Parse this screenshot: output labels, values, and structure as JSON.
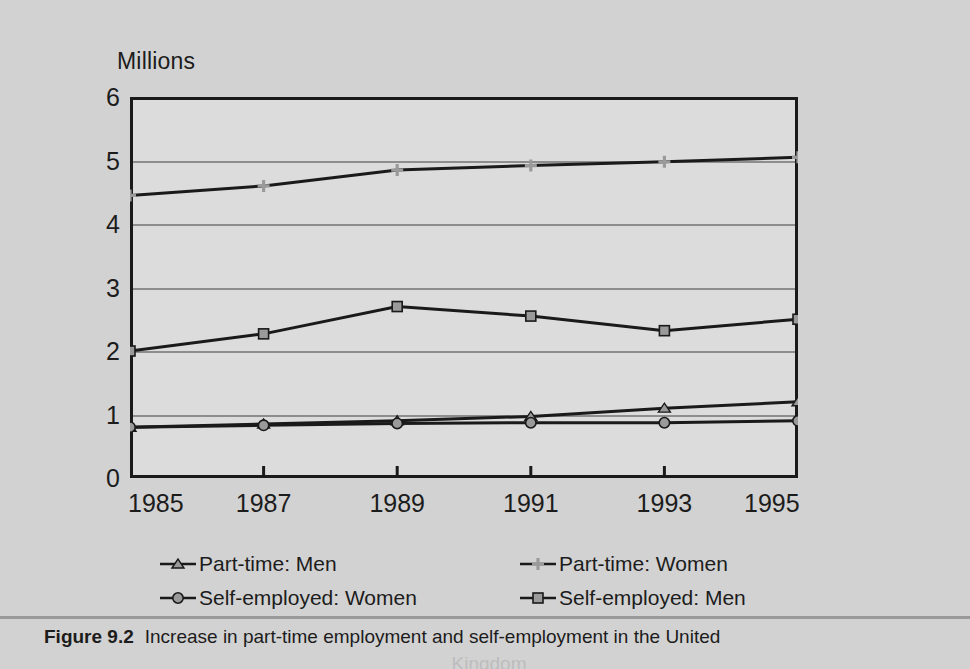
{
  "figure": {
    "caption_label": "Figure 9.2",
    "caption_text": "Increase in part-time employment and self-employment in the United",
    "caption_text_line2": "Kingdom"
  },
  "axis_unit_label": "Millions",
  "colors": {
    "background": "#d2d2d2",
    "plot_background": "#dcdcdc",
    "axis": "#1a1a1a",
    "gridline": "#8d8d8d",
    "series_line": "#1a1a1a",
    "marker_fill": "#9a9a9a"
  },
  "chart_data": {
    "type": "line",
    "title": "",
    "xlabel": "",
    "ylabel": "Millions",
    "x": [
      1985,
      1987,
      1989,
      1991,
      1993,
      1995
    ],
    "xtick_labels": [
      "1985",
      "1987",
      "1989",
      "1991",
      "1993",
      "1995"
    ],
    "ytick_labels": [
      "0",
      "1",
      "2",
      "3",
      "4",
      "5",
      "6"
    ],
    "ylim": [
      0,
      6
    ],
    "ytick_step": 1,
    "grid": true,
    "legend_position": "bottom",
    "series": [
      {
        "name": "Part-time: Men",
        "marker": "triangle",
        "values": [
          0.8,
          0.85,
          0.9,
          0.97,
          1.1,
          1.2
        ]
      },
      {
        "name": "Part-time: Women",
        "marker": "plus",
        "values": [
          4.45,
          4.6,
          4.85,
          4.92,
          4.98,
          5.05
        ]
      },
      {
        "name": "Self-employed: Women",
        "marker": "circle",
        "values": [
          0.8,
          0.83,
          0.86,
          0.87,
          0.87,
          0.9
        ]
      },
      {
        "name": "Self-employed: Men",
        "marker": "square",
        "values": [
          2.0,
          2.27,
          2.7,
          2.55,
          2.32,
          2.5
        ]
      }
    ]
  },
  "legend": {
    "items": [
      {
        "label": "Part-time: Men",
        "marker": "triangle",
        "column": 0,
        "row": 0
      },
      {
        "label": "Part-time: Women",
        "marker": "plus",
        "column": 1,
        "row": 0
      },
      {
        "label": "Self-employed: Women",
        "marker": "circle",
        "column": 0,
        "row": 1
      },
      {
        "label": "Self-employed: Men",
        "marker": "square",
        "column": 1,
        "row": 1
      }
    ]
  }
}
